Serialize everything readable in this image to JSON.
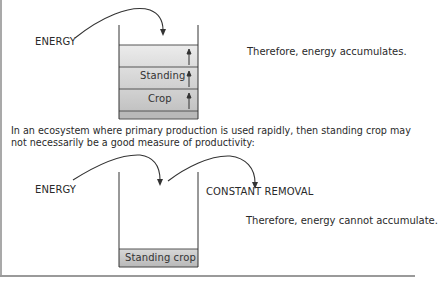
{
  "diagram": {
    "top": {
      "energy_label": "ENERGY",
      "layers": [
        {
          "label": "",
          "color": "#e6e6e6"
        },
        {
          "label": "Standing",
          "color": "#d6d6d6"
        },
        {
          "label": "Crop",
          "color": "#c7c7c7"
        },
        {
          "label": "",
          "color": "#b4b4b4"
        }
      ],
      "conclusion": "Therefore, energy accumulates."
    },
    "explanation": "In an ecosystem where primary production is used rapidly, then standing crop may not necessarily be a good measure of productivity:",
    "bottom": {
      "energy_label": "ENERGY",
      "removal_label": "CONSTANT REMOVAL",
      "base_label": "Standing crop",
      "base_color": "#c4c4c4",
      "conclusion": "Therefore, energy cannot accumulate."
    },
    "colors": {
      "line": "#333333",
      "frame": "#a9a9a9"
    }
  }
}
